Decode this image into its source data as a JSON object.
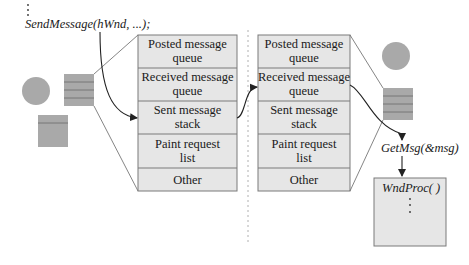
{
  "code": {
    "call": "SendMessage(hWnd, ...);",
    "getmsg": "GetMsg(&msg)",
    "wndproc": "WndProc(    )"
  },
  "left_thread_queues": [
    {
      "line1": "Posted message",
      "line2": "queue"
    },
    {
      "line1": "Received message",
      "line2": "queue"
    },
    {
      "line1": "Sent message",
      "line2": "stack"
    },
    {
      "line1": "Paint request",
      "line2": "list"
    },
    {
      "line1": "Other",
      "line2": ""
    }
  ],
  "right_thread_queues": [
    {
      "line1": "Posted message",
      "line2": "queue"
    },
    {
      "line1": "Received message",
      "line2": "queue"
    },
    {
      "line1": "Sent message",
      "line2": "stack"
    },
    {
      "line1": "Paint request",
      "line2": "list"
    },
    {
      "line1": "Other",
      "line2": ""
    }
  ],
  "colors": {
    "box_fill": "#e6e6e6",
    "box_stroke": "#7a7a7a",
    "shape_fill": "#a9a9a9",
    "divider": "#b0b0b0"
  }
}
